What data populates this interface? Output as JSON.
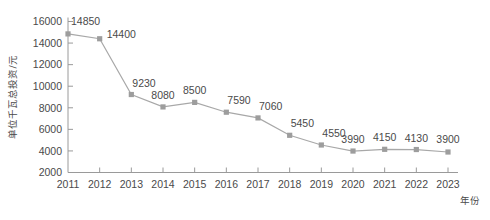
{
  "chart_data": {
    "type": "line",
    "title": "",
    "subtitle": "",
    "xlabel": "年份",
    "ylabel": "单位千瓦总投资/元",
    "categories": [
      "2011",
      "2012",
      "2013",
      "2014",
      "2015",
      "2016",
      "2017",
      "2018",
      "2019",
      "2020",
      "2021",
      "2022",
      "2023"
    ],
    "values": [
      14850,
      14400,
      9230,
      8080,
      8500,
      7590,
      7060,
      5450,
      4550,
      3990,
      4150,
      4130,
      3900
    ],
    "point_labels": [
      "14850",
      "14400",
      "9230",
      "8080",
      "8500",
      "7590",
      "7060",
      "5450",
      "4550",
      "3990",
      "4150",
      "4130",
      "3900"
    ],
    "ylim": [
      2000,
      16000
    ],
    "y_ticks": [
      2000,
      4000,
      6000,
      8000,
      10000,
      12000,
      14000,
      16000
    ],
    "y_tick_labels": [
      "2000",
      "4000",
      "6000",
      "8000",
      "10000",
      "12000",
      "14000",
      "16000"
    ],
    "x_ticks": [
      "2011",
      "2012",
      "2013",
      "2014",
      "2015",
      "2016",
      "2017",
      "2018",
      "2019",
      "2020",
      "2021",
      "2022",
      "2023"
    ],
    "grid": false,
    "legend": false,
    "legend_position": "none",
    "marker": "square",
    "colors": {
      "line": "#a8a8a8",
      "marker": "#9d9d9d",
      "axis": "#9a9a9a",
      "text": "#4a4a4a",
      "background": "#ffffff"
    }
  }
}
